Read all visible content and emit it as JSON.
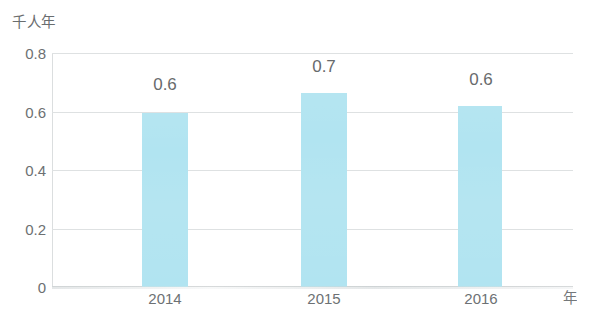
{
  "chart_data": {
    "type": "bar",
    "title": "",
    "subtitle": "",
    "xlabel": "年",
    "ylabel": "千人年",
    "categories": [
      "2014",
      "2015",
      "2016"
    ],
    "values": [
      0.6,
      0.7,
      0.6
    ],
    "bar_pixel_values": [
      0.595,
      0.665,
      0.62
    ],
    "data_labels": [
      "0.6",
      "0.7",
      "0.6"
    ],
    "series": [
      {
        "name": "千人年",
        "values": [
          0.6,
          0.7,
          0.6
        ]
      }
    ],
    "ylim": [
      0,
      0.8
    ],
    "yticks": [
      "0.8",
      "0.6",
      "0.4",
      "0.2",
      "0"
    ],
    "ytick_values": [
      0.8,
      0.6,
      0.4,
      0.2,
      0
    ],
    "grid": true,
    "grid_axis": "y",
    "legend": false,
    "legend_position": "none",
    "bar_color": "#ace3f0",
    "grid_color": "#dcdfe0",
    "text_color": "#626668"
  }
}
